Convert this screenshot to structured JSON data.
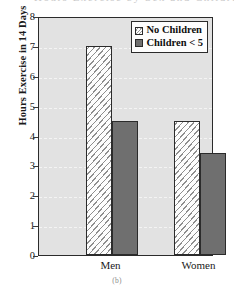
{
  "figure": {
    "caption": "(b)",
    "ghost_text_above": "Hours Exercise by Sex and Children"
  },
  "chart_data": {
    "type": "bar",
    "title": "",
    "subtitle": "",
    "xlabel": "",
    "ylabel": "Hours Exercise in 14 Days",
    "categories": [
      "Men",
      "Women"
    ],
    "series": [
      {
        "name": "No Children",
        "values": [
          7.0,
          4.5
        ],
        "fill": "hatched-diagonal",
        "color": "#fdfdfd"
      },
      {
        "name": "Children < 5",
        "values": [
          4.5,
          3.4
        ],
        "fill": "solid",
        "color": "#6f6f6f"
      }
    ],
    "ylim": [
      0,
      8
    ],
    "ytick_labels": [
      "0",
      "1",
      "2",
      "3",
      "4",
      "5",
      "6",
      "7",
      "8"
    ],
    "ytick_values": [
      0,
      1,
      2,
      3,
      4,
      5,
      6,
      7,
      8
    ],
    "grid": true,
    "grid_axis": "y",
    "legend_position": "top-right-inside",
    "plot_background": "#e2e2e2",
    "axis_color": "#2b2b2b"
  },
  "legend": {
    "entries": [
      {
        "label": "No Children",
        "swatch": "hatched-diagonal"
      },
      {
        "label": "Children < 5",
        "swatch": "solid-gray"
      }
    ]
  }
}
